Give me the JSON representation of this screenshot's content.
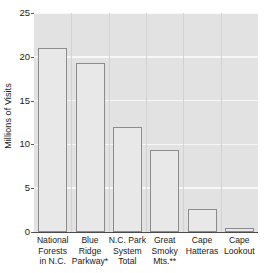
{
  "chart_data": {
    "type": "bar",
    "title": "",
    "xlabel": "",
    "ylabel": "Millions of Visits",
    "categories": [
      "National\nForests\nin N.C.",
      "Blue\nRidge\nParkway*",
      "N.C. Park\nSystem\nTotal",
      "Great\nSmoky\nMts.**",
      "Cape\nHatteras",
      "Cape\nLookout"
    ],
    "values": [
      21.0,
      19.3,
      12.0,
      9.4,
      2.6,
      0.5
    ],
    "ylim": [
      0,
      25
    ],
    "yticks": [
      0,
      5,
      10,
      15,
      20,
      25
    ],
    "ytick_labels": [
      "0",
      "5",
      "10",
      "15",
      "20",
      "25"
    ],
    "grid": true,
    "grid_axis": "y",
    "legend": "none",
    "bar_fill_color": "#e8e8e8",
    "bar_edge_color": "#8c8c8c",
    "plot_background_color": "#e2e2e2",
    "gridline_color": "#f7f7f7",
    "axis_color": "#4a4a4a",
    "text_color": "#1a1a1a"
  }
}
